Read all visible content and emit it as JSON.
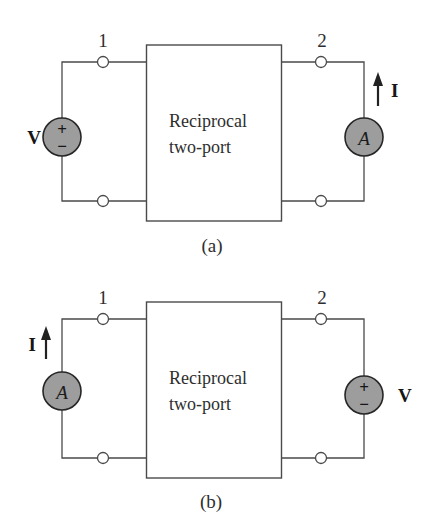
{
  "colors": {
    "paper": "#ffffff",
    "wire": "#4a4a4a",
    "text": "#2e2e2e",
    "bold_text": "#161616",
    "meter_fill": "#9d9d9d",
    "meter_stroke": "#262626",
    "arrow": "#222222"
  },
  "figures": [
    {
      "caption": "(a)",
      "port1_label": "1",
      "port2_label": "2",
      "box_line1": "Reciprocal",
      "box_line2": "two-port",
      "source_label": "V",
      "source_plus": "+",
      "source_minus": "−",
      "meter_label": "A",
      "current_label": "I",
      "source_side": "left",
      "meter_side": "right"
    },
    {
      "caption": "(b)",
      "port1_label": "1",
      "port2_label": "2",
      "box_line1": "Reciprocal",
      "box_line2": "two-port",
      "source_label": "V",
      "source_plus": "+",
      "source_minus": "−",
      "meter_label": "A",
      "current_label": "I",
      "source_side": "right",
      "meter_side": "left"
    }
  ]
}
